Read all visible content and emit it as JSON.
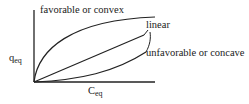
{
  "diagram": {
    "title": "",
    "y_axis": {
      "label": "q",
      "subscript": "eq"
    },
    "x_axis": {
      "label": "C",
      "subscript": "eq"
    },
    "curves": [
      {
        "id": "convex",
        "label": "favorable or convex"
      },
      {
        "id": "linear",
        "label": "linear"
      },
      {
        "id": "concave",
        "label": "unfavorable or concave"
      }
    ]
  }
}
